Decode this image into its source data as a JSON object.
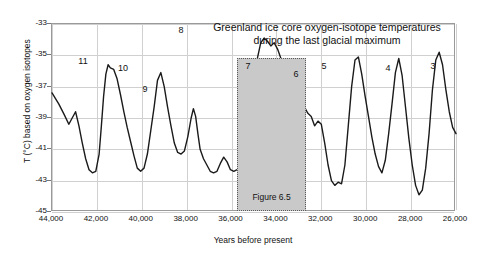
{
  "chart_data": {
    "type": "line",
    "title": "Greenland ice core oxygen-isotope temperatures during the last glacial maximum",
    "title_line1": "Greenland ice core oxygen-isotope temperatures",
    "title_line2": "during the last glacial maximum",
    "xlabel": "Years before present",
    "ylabel": "T (°C) based on oxygen isotopes",
    "xlim": [
      44000,
      26000
    ],
    "ylim": [
      -45,
      -33
    ],
    "x_inverted": true,
    "grid": true,
    "legend": null,
    "xticks": [
      44000,
      42000,
      40000,
      38000,
      36000,
      34000,
      32000,
      30000,
      28000,
      26000
    ],
    "xtick_labels": [
      "44,000",
      "42,000",
      "40,000",
      "38,000",
      "36,000",
      "34,000",
      "32,000",
      "30,000",
      "28,000",
      "26,000"
    ],
    "yticks": [
      -33,
      -35,
      -37,
      -39,
      -41,
      -43,
      -45
    ],
    "ytick_labels": [
      "-33",
      "-35",
      "-37",
      "-39",
      "-41",
      "-43",
      "-45"
    ],
    "series_name": "Greenland ice core oxygen-isotope temperature",
    "line_color": "#1a1a1a",
    "x": [
      44000,
      43700,
      43450,
      43250,
      43100,
      42950,
      42800,
      42650,
      42500,
      42350,
      42200,
      42050,
      41900,
      41800,
      41700,
      41600,
      41500,
      41400,
      41250,
      41100,
      40950,
      40800,
      40650,
      40500,
      40350,
      40200,
      40050,
      39900,
      39750,
      39600,
      39450,
      39300,
      39150,
      39000,
      38850,
      38700,
      38550,
      38400,
      38250,
      38100,
      37950,
      37800,
      37700,
      37600,
      37500,
      37400,
      37250,
      37100,
      36950,
      36800,
      36650,
      36500,
      36350,
      36200,
      36050,
      35900,
      35750,
      35600,
      35450,
      35300,
      35150,
      35000,
      34850,
      34700,
      34550,
      34400,
      34250,
      34100,
      33950,
      33800,
      33650,
      33500,
      33350,
      33200,
      33050,
      32900,
      32750,
      32600,
      32450,
      32300,
      32150,
      32000,
      31850,
      31700,
      31550,
      31400,
      31250,
      31100,
      30950,
      30800,
      30650,
      30500,
      30350,
      30200,
      30050,
      29900,
      29750,
      29600,
      29450,
      29300,
      29150,
      29000,
      28850,
      28700,
      28550,
      28400,
      28250,
      28100,
      27950,
      27800,
      27650,
      27500,
      27350,
      27200,
      27050,
      26900,
      26750,
      26600,
      26450,
      26300,
      26150,
      26000
    ],
    "y": [
      -37.4,
      -38.1,
      -38.8,
      -39.4,
      -39.0,
      -38.6,
      -39.5,
      -40.6,
      -41.6,
      -42.3,
      -42.5,
      -42.4,
      -41.3,
      -39.5,
      -37.6,
      -36.2,
      -35.6,
      -35.8,
      -35.9,
      -36.5,
      -37.5,
      -38.6,
      -39.6,
      -40.5,
      -41.4,
      -42.2,
      -42.4,
      -42.2,
      -41.3,
      -39.8,
      -38.3,
      -36.6,
      -36.1,
      -37.0,
      -38.3,
      -39.5,
      -40.6,
      -41.2,
      -41.3,
      -41.1,
      -40.2,
      -39.0,
      -38.4,
      -38.9,
      -40.0,
      -41.0,
      -41.6,
      -42.0,
      -42.4,
      -42.5,
      -42.4,
      -41.9,
      -41.5,
      -41.8,
      -42.3,
      -42.4,
      -42.3,
      -42.3,
      -42.3,
      -41.5,
      -39.5,
      -37.0,
      -35.2,
      -34.2,
      -33.9,
      -34.1,
      -34.4,
      -34.2,
      -34.6,
      -35.2,
      -35.7,
      -36.1,
      -36.4,
      -36.8,
      -37.3,
      -37.8,
      -38.3,
      -38.7,
      -38.9,
      -39.5,
      -39.2,
      -39.4,
      -40.6,
      -42.0,
      -43.0,
      -43.3,
      -43.1,
      -43.2,
      -42.0,
      -39.5,
      -37.0,
      -35.3,
      -35.1,
      -36.2,
      -37.6,
      -38.9,
      -40.2,
      -41.3,
      -42.1,
      -42.5,
      -41.7,
      -40.0,
      -38.1,
      -36.1,
      -35.2,
      -36.3,
      -38.3,
      -40.3,
      -42.0,
      -43.3,
      -43.9,
      -43.6,
      -42.2,
      -40.0,
      -37.2,
      -35.3,
      -34.8,
      -35.6,
      -37.2,
      -38.6,
      -39.6,
      -40.0
    ],
    "events": [
      {
        "label": "11",
        "x": 41500,
        "y": -35.6
      },
      {
        "label": "10",
        "x": 39300,
        "y": -36.6
      },
      {
        "label": "9",
        "x": 37700,
        "y": -38.4
      },
      {
        "label": "8",
        "x": 34550,
        "y": -33.9
      },
      {
        "label": "7",
        "x": 35000,
        "y": -34.2
      },
      {
        "label": "6",
        "x": 32000,
        "y": -35.1
      },
      {
        "label": "5",
        "x": 31400,
        "y": -35.3
      },
      {
        "label": "4",
        "x": 28550,
        "y": -35.2
      },
      {
        "label": "3",
        "x": 27350,
        "y": -34.8
      }
    ],
    "annotation": {
      "label": "Figure 6.5",
      "x_start": 35700,
      "x_end": 32650,
      "fill_color": "#c9c9c9",
      "border_style": "dotted"
    }
  },
  "peak_labels": [
    {
      "text": "11",
      "left": 76,
      "top": 57
    },
    {
      "text": "10",
      "left": 116,
      "top": 64
    },
    {
      "text": "9",
      "left": 138,
      "top": 85
    },
    {
      "text": "8",
      "left": 174,
      "top": 26
    },
    {
      "text": "7",
      "left": 241,
      "top": 62
    },
    {
      "text": "6",
      "left": 289,
      "top": 70
    },
    {
      "text": "5",
      "left": 317,
      "top": 62
    },
    {
      "text": "4",
      "left": 381,
      "top": 64
    },
    {
      "text": "3",
      "left": 426,
      "top": 62
    }
  ]
}
